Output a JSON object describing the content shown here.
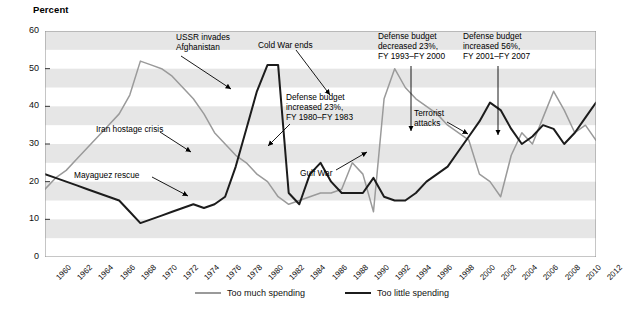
{
  "chart_data": {
    "type": "line",
    "title": "",
    "ylabel": "Percent",
    "xlabel": "",
    "ylim": [
      0,
      60
    ],
    "yticks": [
      0,
      10,
      20,
      30,
      40,
      50,
      60
    ],
    "xlim": [
      1960,
      2012
    ],
    "grid": "horizontal-bands",
    "legend_position": "bottom",
    "x": [
      1960,
      1961,
      1962,
      1963,
      1964,
      1965,
      1966,
      1967,
      1968,
      1969,
      1970,
      1971,
      1972,
      1973,
      1974,
      1975,
      1976,
      1977,
      1978,
      1979,
      1980,
      1981,
      1982,
      1983,
      1984,
      1985,
      1986,
      1987,
      1988,
      1989,
      1990,
      1991,
      1992,
      1993,
      1994,
      1995,
      1996,
      1997,
      1998,
      1999,
      2000,
      2001,
      2002,
      2003,
      2004,
      2005,
      2006,
      2007,
      2008,
      2009,
      2010,
      2011,
      2012
    ],
    "series": [
      {
        "name": "Too much spending",
        "color": "#9a9a9a",
        "values": [
          18,
          21,
          23,
          26,
          29,
          32,
          35,
          38,
          43,
          52,
          51,
          50,
          48,
          45,
          42,
          38,
          33,
          30,
          27,
          25,
          22,
          20,
          16,
          14,
          15,
          16,
          17,
          17,
          18,
          25,
          22,
          12,
          42,
          50,
          45,
          42,
          40,
          38,
          35,
          33,
          31,
          22,
          20,
          16,
          27,
          33,
          30,
          37,
          44,
          39,
          33,
          35,
          31
        ]
      },
      {
        "name": "Too little spending",
        "color": "#1c1c1c",
        "values": [
          22,
          21,
          20,
          19,
          18,
          17,
          16,
          15,
          12,
          9,
          10,
          11,
          12,
          13,
          14,
          13,
          14,
          16,
          24,
          34,
          44,
          51,
          51,
          17,
          14,
          22,
          25,
          20,
          17,
          17,
          17,
          21,
          16,
          15,
          15,
          17,
          20,
          22,
          24,
          28,
          32,
          36,
          41,
          39,
          34,
          30,
          32,
          35,
          34,
          30,
          33,
          37,
          41
        ]
      }
    ],
    "annotations": [
      {
        "id": "ussr-invades-afghanistan",
        "text": "USSR invades\nAfghanistan",
        "target_year": 1980,
        "target_value": 44
      },
      {
        "id": "cold-war-ends",
        "text": "Cold War ends",
        "target_year": 1989,
        "target_value": 25
      },
      {
        "id": "defense-budget-decreased",
        "text": "Defense budget\ndecreased 23%,\nFY 1993–FY 2000",
        "target_year": 1998,
        "target_value": 35
      },
      {
        "id": "defense-budget-increased-56",
        "text": "Defense budget\nincreased 56%,\nFY 2001–FY 2007",
        "target_year": 2004,
        "target_value": 27
      },
      {
        "id": "defense-budget-increased-23",
        "text": "Defense budget\nincreased 23%,\nFY 1980–FY 1983",
        "target_year": 1983,
        "target_value": 17
      },
      {
        "id": "terrorist-attacks",
        "text": "Terrorist\nattacks",
        "target_year": 2002,
        "target_value": 41
      },
      {
        "id": "iran-hostage-crisis",
        "text": "Iran hostage crisis",
        "target_year": 1978,
        "target_value": 25
      },
      {
        "id": "mayaguez-rescue",
        "text": "Mayaguez rescue",
        "target_year": 1975,
        "target_value": 13
      },
      {
        "id": "gulf-war",
        "text": "Gulf War",
        "target_year": 1991,
        "target_value": 12
      }
    ],
    "xtick_labels": [
      "1960",
      "1962",
      "1964",
      "1966",
      "1968",
      "1970",
      "1972",
      "1974",
      "1976",
      "1978",
      "1980",
      "1982",
      "1984",
      "1986",
      "1988",
      "1990",
      "1992",
      "1994",
      "1996",
      "1998",
      "2000",
      "2002",
      "2004",
      "2006",
      "2008",
      "2010",
      "2012"
    ]
  },
  "legend": {
    "too_much": "Too much spending",
    "too_little": "Too little spending"
  }
}
